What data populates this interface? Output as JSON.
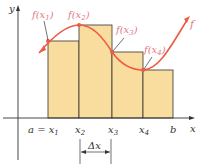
{
  "diagram": {
    "colors": {
      "rect_fill": "#f8dd9e",
      "rect_stroke": "#333333",
      "curve": "#ee5a44",
      "point": "#ee5a44",
      "label_pink": "#e07b86",
      "axis": "#333333"
    },
    "axes": {
      "y_label": "y",
      "x_label": "x"
    },
    "x_ticks": [
      {
        "label": "a = x",
        "sub": "1"
      },
      {
        "label": "x",
        "sub": "2"
      },
      {
        "label": "x",
        "sub": "3"
      },
      {
        "label": "x",
        "sub": "4"
      },
      {
        "label": "b",
        "sub": ""
      }
    ],
    "function_labels": [
      {
        "label": "f(x",
        "sub": "1",
        "close": ")"
      },
      {
        "label": "f(x",
        "sub": "2",
        "close": ")"
      },
      {
        "label": "f(x",
        "sub": "3",
        "close": ")"
      },
      {
        "label": "f(x",
        "sub": "4",
        "close": ")"
      }
    ],
    "curve_label": "f",
    "delta_label": "Δx"
  }
}
